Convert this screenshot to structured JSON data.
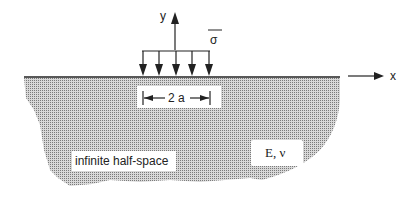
{
  "diagram": {
    "axis_x_label": "x",
    "axis_y_label": "y",
    "load_label": "σ",
    "width_label": "2 a",
    "region_label": "infinite half-space",
    "material_label": "E, ν",
    "colors": {
      "ink": "#222222",
      "stipple": "#9a9a9a",
      "background": "#ffffff"
    }
  }
}
